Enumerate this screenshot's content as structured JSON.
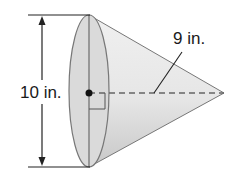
{
  "figure": {
    "shape": "cone",
    "labels": {
      "diameter": "10 in.",
      "height": "9 in."
    },
    "marks": {
      "center_point": "center-dot",
      "right_angle": "right-angle-mark",
      "height_line": "dashed"
    },
    "colors": {
      "base_fill": "#d9d9d9",
      "cone_fill": "#e8e8e8",
      "stroke": "#555555",
      "dim_line": "#222222"
    }
  }
}
